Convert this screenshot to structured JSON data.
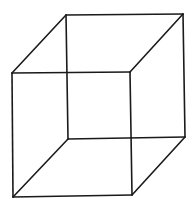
{
  "figure": {
    "background": "#ffffff",
    "stroke_color": "#1a1a1a",
    "stroke_width": 1.6,
    "vertices": {
      "front_top_left": [
        12,
        73
      ],
      "front_top_right": [
        130,
        72
      ],
      "front_bottom_left": [
        13,
        197
      ],
      "front_bottom_right": [
        132,
        195
      ],
      "back_top_left": [
        66,
        15
      ],
      "back_top_right": [
        183,
        14
      ],
      "back_bottom_left": [
        68,
        139
      ],
      "back_bottom_right": [
        185,
        137
      ]
    },
    "edges": [
      {
        "name": "front-top-edge",
        "from": "front_top_left",
        "to": "front_top_right"
      },
      {
        "name": "front-bottom-edge",
        "from": "front_bottom_left",
        "to": "front_bottom_right"
      },
      {
        "name": "front-left-edge",
        "from": "front_top_left",
        "to": "front_bottom_left"
      },
      {
        "name": "front-right-edge",
        "from": "front_top_right",
        "to": "front_bottom_right"
      },
      {
        "name": "back-top-edge",
        "from": "back_top_left",
        "to": "back_top_right"
      },
      {
        "name": "back-bottom-edge",
        "from": "back_bottom_left",
        "to": "back_bottom_right"
      },
      {
        "name": "back-left-edge",
        "from": "back_top_left",
        "to": "back_bottom_left"
      },
      {
        "name": "back-right-edge",
        "from": "back_top_right",
        "to": "back_bottom_right"
      },
      {
        "name": "top-left-connector",
        "from": "front_top_left",
        "to": "back_top_left"
      },
      {
        "name": "top-right-connector",
        "from": "front_top_right",
        "to": "back_top_right"
      },
      {
        "name": "bottom-left-connector",
        "from": "front_bottom_left",
        "to": "back_bottom_left"
      },
      {
        "name": "bottom-right-connector",
        "from": "front_bottom_right",
        "to": "back_bottom_right"
      }
    ]
  }
}
